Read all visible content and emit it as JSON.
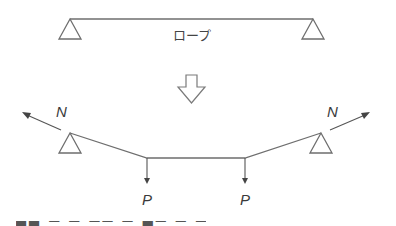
{
  "diagram": {
    "top": {
      "rope_label": "ロープ",
      "rope": {
        "x1": 70,
        "y": 19,
        "x2": 313
      },
      "supports": [
        {
          "apex_x": 70,
          "apex_y": 19,
          "base_y": 39,
          "half_width": 11
        },
        {
          "apex_x": 313,
          "apex_y": 19,
          "base_y": 39,
          "half_width": 11
        }
      ]
    },
    "transition_arrow": {
      "icon": "hollow-down-arrow-icon"
    },
    "bottom": {
      "supports": [
        {
          "apex_x": 70,
          "apex_y": 133,
          "base_y": 153,
          "half_width": 11
        },
        {
          "apex_x": 321,
          "apex_y": 133,
          "base_y": 153,
          "half_width": 11
        }
      ],
      "rope_points": [
        [
          70,
          133
        ],
        [
          147,
          158
        ],
        [
          245,
          158
        ],
        [
          321,
          133
        ]
      ],
      "tension_label": "N",
      "tension_forces": [
        {
          "from": [
            61,
            130
          ],
          "to": [
            23,
            113
          ],
          "label": "N"
        },
        {
          "from": [
            330,
            130
          ],
          "to": [
            369,
            113
          ],
          "label": "N"
        }
      ],
      "load_label": "P",
      "loads": [
        {
          "x": 147,
          "from_y": 158,
          "to_y": 183,
          "label": "P"
        },
        {
          "x": 245,
          "from_y": 158,
          "to_y": 183,
          "label": "P"
        }
      ]
    },
    "caption": {
      "visible": "partially cropped at bottom edge (illegible)"
    },
    "colors": {
      "line": "#6e6e6e",
      "force": "#555555",
      "text": "#3a3a3a",
      "background": "#ffffff"
    }
  }
}
